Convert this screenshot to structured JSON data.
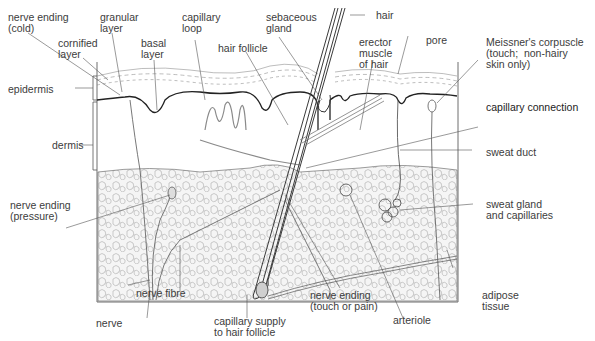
{
  "diagram": {
    "regions": {
      "epidermis": "epidermis",
      "dermis": "dermis"
    },
    "labels": {
      "nerve_ending_cold": "nerve ending\n(cold)",
      "granular_layer": "granular\nlayer",
      "cornified_layer": "cornified\nlayer",
      "basal_layer": "basal\nlayer",
      "capillary_loop": "capillary\nloop",
      "hair_follicle": "hair follicle",
      "sebaceous_gland": "sebaceous\ngland",
      "hair": "hair",
      "erector_muscle": "erector\nmuscle\nof hair",
      "pore": "pore",
      "meissners_corpuscle": "Meissner's corpuscle\n(touch;  non-hairy\nskin only)",
      "capillary_connection": "capillary connection",
      "sweat_duct": "sweat duct",
      "nerve_ending_pressure": "nerve ending\n(pressure)",
      "sweat_gland": "sweat gland\nand capillaries",
      "nerve": "nerve",
      "nerve_fibre": "nerve fibre",
      "capillary_supply": "capillary supply\nto hair follicle",
      "nerve_ending_touch": "nerve ending\n(touch or pain)",
      "arteriole": "arteriole",
      "adipose_tissue": "adipose\ntissue"
    },
    "colors": {
      "line": "#3a3a3a",
      "leader": "#555555",
      "fat_fill": "#f4f4f4",
      "background": "#ffffff"
    }
  }
}
